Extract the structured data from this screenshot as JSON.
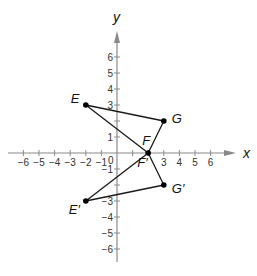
{
  "diagram": {
    "type": "coordinate-plane-reflection",
    "axes": {
      "x_label": "x",
      "y_label": "y",
      "x_ticks": [
        -6,
        -5,
        -4,
        -3,
        -2,
        -1,
        1,
        2,
        3,
        4,
        5,
        6
      ],
      "x_tick_labels": [
        "−6",
        "−5",
        "−4",
        "−3",
        "−2",
        "−1",
        "",
        "",
        "3",
        "4",
        "5",
        "6"
      ],
      "y_ticks": [
        6,
        5,
        4,
        3,
        2,
        1,
        -1,
        -2,
        -3,
        -4,
        -5,
        -6
      ],
      "y_tick_labels": [
        "6",
        "5",
        "4",
        "3",
        "",
        "1",
        "−1",
        "",
        "−3",
        "−4",
        "−5",
        "−6"
      ],
      "origin_label": "0",
      "range": [
        -6,
        6
      ]
    },
    "points": [
      {
        "name": "E",
        "x": -2,
        "y": 3,
        "label": "E"
      },
      {
        "name": "F",
        "x": 2,
        "y": 0,
        "label": "F"
      },
      {
        "name": "G",
        "x": 3,
        "y": 2,
        "label": "G"
      },
      {
        "name": "E'",
        "x": -2,
        "y": -3,
        "label": "E′"
      },
      {
        "name": "F'",
        "x": 2,
        "y": 0,
        "label": "F′"
      },
      {
        "name": "G'",
        "x": 3,
        "y": -2,
        "label": "G′"
      }
    ],
    "triangles": [
      {
        "name": "EFG",
        "vertices": [
          "E",
          "F",
          "G"
        ]
      },
      {
        "name": "E'F'G'",
        "vertices": [
          "E'",
          "F'",
          "G'"
        ]
      }
    ],
    "colors": {
      "axis": "#8a8a8a",
      "triangle": "#1a1a1a",
      "point": "#000000"
    }
  }
}
